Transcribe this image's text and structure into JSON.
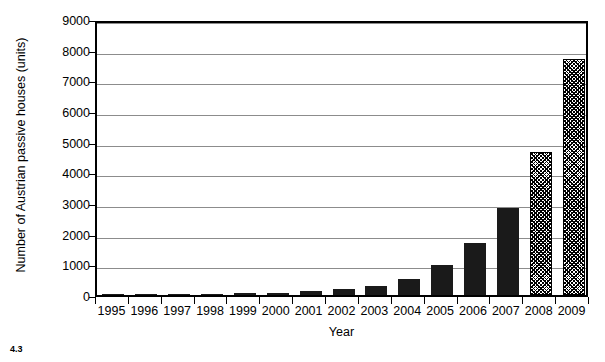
{
  "chart_data": {
    "type": "bar",
    "title": "",
    "xlabel": "Year",
    "ylabel": "Number of Austrian passive houses (units)",
    "categories": [
      "1995",
      "1996",
      "1997",
      "1998",
      "1999",
      "2000",
      "2001",
      "2002",
      "2003",
      "2004",
      "2005",
      "2006",
      "2007",
      "2008",
      "2009"
    ],
    "values": [
      5,
      10,
      15,
      30,
      55,
      75,
      120,
      180,
      280,
      520,
      970,
      1680,
      2830,
      4650,
      7680
    ],
    "series": [
      {
        "name": "Austrian passive houses",
        "values": [
          5,
          10,
          15,
          30,
          55,
          75,
          120,
          180,
          280,
          520,
          970,
          1680,
          2830,
          4650,
          7680
        ],
        "styles": [
          "solid",
          "solid",
          "solid",
          "solid",
          "solid",
          "solid",
          "solid",
          "solid",
          "solid",
          "solid",
          "solid",
          "solid",
          "solid",
          "hatched",
          "hatched"
        ]
      }
    ],
    "ylim": [
      0,
      9000
    ],
    "yticks": [
      0,
      1000,
      2000,
      3000,
      4000,
      5000,
      6000,
      7000,
      8000,
      9000
    ],
    "ytick_labels": [
      "0",
      "1000",
      "2000",
      "3000",
      "4000",
      "5000",
      "6000",
      "7000",
      "8000",
      "9000"
    ],
    "grid": true,
    "grid_axis": "y",
    "legend": false,
    "bar_color": "#1a1a1a",
    "hatched_note": "2008 and 2009 bars are drawn with a cross-hatch / checkered fill pattern instead of solid black"
  },
  "figure": {
    "caption": "4.3"
  }
}
